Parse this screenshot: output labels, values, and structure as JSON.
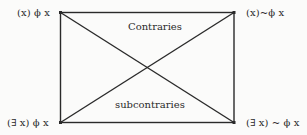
{
  "diagram": {
    "corners": {
      "top_left": "(x) ϕ x",
      "top_right": "(x)~ϕ x",
      "bottom_left": "(∃ x) ϕ x",
      "bottom_right": "(∃ x) ~ ϕ x"
    },
    "relations": {
      "top": "Contraries",
      "bottom": "subcontraries"
    },
    "colors": {
      "line": "#2a2a2a",
      "text": "#2a2a2a",
      "background": "#fbfbfa"
    }
  }
}
